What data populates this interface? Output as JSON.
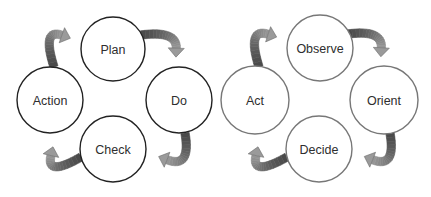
{
  "diagrams": [
    {
      "name": "pdca-cycle",
      "nodes": [
        {
          "label": "Plan"
        },
        {
          "label": "Do"
        },
        {
          "label": "Check"
        },
        {
          "label": "Action"
        }
      ]
    },
    {
      "name": "ooda-loop",
      "nodes": [
        {
          "label": "Observe"
        },
        {
          "label": "Orient"
        },
        {
          "label": "Decide"
        },
        {
          "label": "Act"
        }
      ]
    }
  ],
  "colors": {
    "left_circle_stroke": "#222222",
    "right_circle_stroke": "#777777",
    "arrow_dark": "#4a4a4a",
    "arrow_light": "#9a9a9a",
    "text": "#2e2e2e"
  }
}
